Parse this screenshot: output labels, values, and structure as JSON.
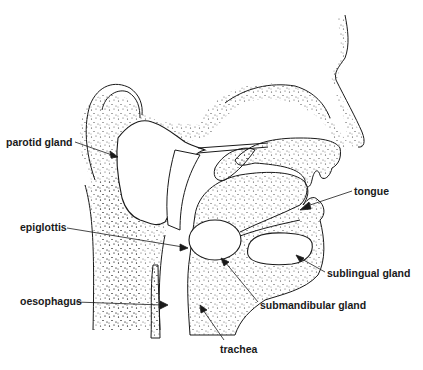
{
  "diagram": {
    "colors": {
      "ink": "#1a1a1a",
      "stipple": "#333333",
      "background": "#ffffff"
    },
    "labels": [
      {
        "id": "parotid",
        "text": "parotid gland",
        "x": 6,
        "y": 142
      },
      {
        "id": "epiglottis",
        "text": "epiglottis",
        "x": 20,
        "y": 225
      },
      {
        "id": "oesophagus",
        "text": "oesophagus",
        "x": 20,
        "y": 299
      },
      {
        "id": "tongue",
        "text": "tongue",
        "x": 354,
        "y": 192
      },
      {
        "id": "sublingual",
        "text": "sublingual gland",
        "x": 327,
        "y": 270
      },
      {
        "id": "submandibular",
        "text": "submandibular gland",
        "x": 260,
        "y": 302
      },
      {
        "id": "trachea",
        "text": "trachea",
        "x": 220,
        "y": 346
      }
    ]
  }
}
